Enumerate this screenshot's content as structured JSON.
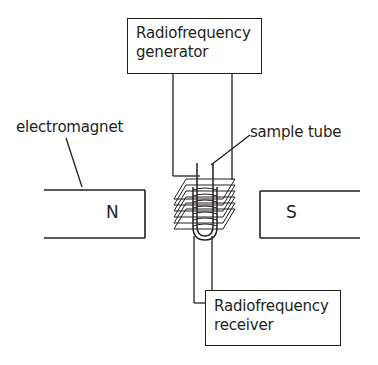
{
  "diagram": {
    "components": {
      "rf_generator": {
        "line1": "Radiofrequency",
        "line2": "generator"
      },
      "rf_receiver": {
        "line1": "Radiofrequency",
        "line2": "receiver"
      },
      "electromagnet_label": "electromagnet",
      "sample_tube_label": "sample tube",
      "north_pole": "N",
      "south_pole": "S"
    },
    "colors": {
      "stroke": "#231f20",
      "background": "#ffffff"
    }
  }
}
